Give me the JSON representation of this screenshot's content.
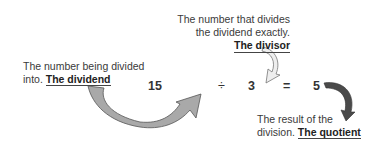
{
  "equation": {
    "dividend": "15",
    "operator": "÷",
    "divisor": "3",
    "equals": "=",
    "quotient": "5"
  },
  "labels": {
    "dividend": {
      "text": "The number being divided into.",
      "term": "The dividend"
    },
    "divisor": {
      "line1": "The number that divides",
      "line2": "the dividend exactly.",
      "term": "The divisor"
    },
    "quotient": {
      "line1": "The result of the",
      "line2": "division.",
      "term": "The quotient"
    }
  },
  "colors": {
    "arrow_fill": "#a9a9a9",
    "arrow_stroke": "#555555",
    "quotient_arrow": "#4a4a4a"
  }
}
